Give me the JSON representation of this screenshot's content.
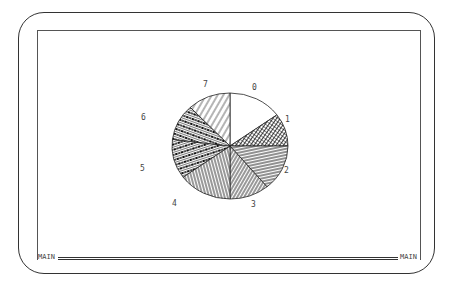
{
  "status_bar": {
    "left_label": "MAIN",
    "right_label": "MAIN"
  },
  "chart_data": {
    "type": "pie",
    "title": "",
    "categories": [
      "0",
      "1",
      "2",
      "3",
      "4",
      "5",
      "6",
      "7"
    ],
    "values": [
      15,
      10,
      14,
      11,
      15,
      12,
      11,
      12
    ],
    "start_angle_deg": 0,
    "direction": "clockwise",
    "fill_patterns": [
      "blank",
      "dense-crosshatch",
      "horizontal-lines",
      "diagonal-lines",
      "near-vertical-lines",
      "thick-diagonal-stripes",
      "thick-diagonal-stripes",
      "light-diagonal-lines"
    ],
    "legend": "none (slice labels placed outside pie)"
  },
  "labels": {
    "slice_0": "0",
    "slice_1": "1",
    "slice_2": "2",
    "slice_3": "3",
    "slice_4": "4",
    "slice_5": "5",
    "slice_6": "6",
    "slice_7": "7"
  }
}
